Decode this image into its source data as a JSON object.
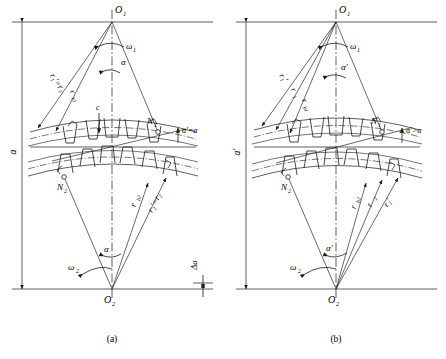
{
  "figure": {
    "background_color": "#ffffff",
    "line_color": "#1a1a1a",
    "captions": [
      {
        "id": "a",
        "text": "(a)"
      },
      {
        "id": "b",
        "text": "(b)"
      }
    ]
  },
  "panel_a": {
    "caption": "(a)",
    "condition": "standard centre distance",
    "centre_distance_label": "a",
    "pinion_centre": "O",
    "pinion_centre_sub": "1",
    "gear_centre": "O",
    "gear_centre_sub": "2",
    "omega1": "ω",
    "omega1_sub": "1",
    "omega2": "ω",
    "omega2_sub": "2",
    "alpha_top": "α",
    "alpha_bottom": "α",
    "pressure_angle_relation": "α'=α",
    "radius_top_outer": "r₁'=r₁",
    "radius_top_inner": "r",
    "radius_top_inner_sub": "b1",
    "radius_bottom_outer": "r₂'=r₂",
    "radius_bottom_inner": "r",
    "radius_bottom_inner_sub": "b2",
    "contact_point_1": "N",
    "contact_point_1_sub": "1",
    "contact_point_2": "N",
    "contact_point_2_sub": "2",
    "clearance_label": "c",
    "delta_a_label": "Δa"
  },
  "panel_b": {
    "caption": "(b)",
    "condition": "enlarged centre distance",
    "centre_distance_label": "a'",
    "pinion_centre": "O",
    "pinion_centre_sub": "1",
    "gear_centre": "O",
    "gear_centre_sub": "2",
    "omega1": "ω",
    "omega1_sub": "1",
    "omega2": "ω",
    "omega2_sub": "2",
    "alpha_top": "α'",
    "alpha_bottom": "α'",
    "pressure_angle_relation": "α'>α",
    "radius_top_1": "r₁'",
    "radius_top_2": "r",
    "radius_top_2_sub": "1",
    "radius_top_3": "r",
    "radius_top_3_sub": "b1",
    "radius_bottom_1": "r",
    "radius_bottom_1_sub": "b2",
    "radius_bottom_2": "r",
    "radius_bottom_2_sub": "2",
    "radius_bottom_3": "r₂'",
    "contact_point_1": "N",
    "contact_point_1_sub": "1",
    "contact_point_2": "N",
    "contact_point_2_sub": "2"
  }
}
